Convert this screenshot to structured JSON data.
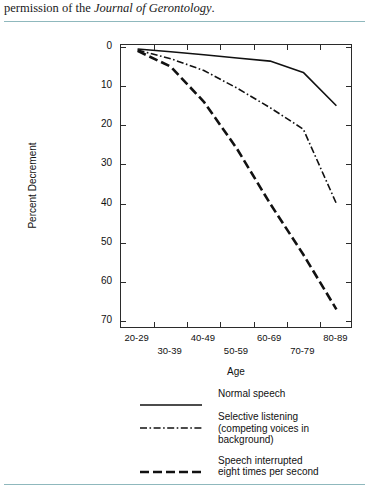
{
  "caption": {
    "prefix": "permission of the ",
    "italic": "Journal of Gerontology",
    "suffix": "."
  },
  "chart_data": {
    "type": "line",
    "title": "",
    "xlabel": "Age",
    "ylabel": "Percent Decrement",
    "categories": [
      "20-29",
      "30-39",
      "40-49",
      "50-59",
      "60-69",
      "70-79",
      "80-89"
    ],
    "ylim": [
      0,
      70
    ],
    "y_inverted": true,
    "yticks": [
      0,
      10,
      20,
      30,
      40,
      50,
      60,
      70
    ],
    "grid": false,
    "legend_position": "below",
    "series": [
      {
        "name": "Normal speech",
        "style": "solid",
        "values": [
          0.5,
          1.2,
          2.0,
          2.8,
          3.6,
          6.5,
          15.0
        ]
      },
      {
        "name": "Selective listening (competing voices in background)",
        "style": "dash-dot",
        "values": [
          0.8,
          3.0,
          6.0,
          10.5,
          15.5,
          21.0,
          40.0
        ]
      },
      {
        "name": "Speech interrupted eight times per second",
        "style": "dashed",
        "values": [
          1.0,
          5.0,
          14.0,
          26.0,
          40.0,
          53.0,
          67.0
        ]
      }
    ]
  },
  "legend": {
    "items": [
      {
        "swatch": "solid-line-swatch",
        "label": "Normal speech",
        "lines": [
          "Normal speech"
        ]
      },
      {
        "swatch": "dash-dot-line-swatch",
        "label": "Selective listening (competing voices in background)",
        "lines": [
          "Selective listening",
          "(competing voices in",
          "background)"
        ]
      },
      {
        "swatch": "dashed-line-swatch",
        "label": "Speech interrupted eight times per second",
        "lines": [
          "Speech interrupted",
          "eight times per second"
        ]
      }
    ]
  },
  "colors": {
    "line": "#111111",
    "frame": "#2b2b2b",
    "rule": "#8fb8bd"
  }
}
